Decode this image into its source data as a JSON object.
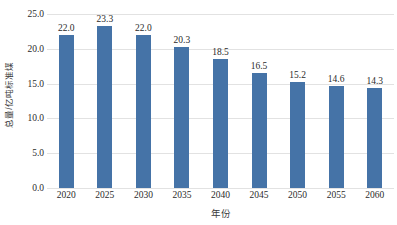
{
  "chart_data": {
    "type": "bar",
    "title": "",
    "subtitle": "",
    "xlabel": "年份",
    "ylabel": "总量/亿吨标准煤",
    "categories": [
      "2020",
      "2025",
      "2030",
      "2035",
      "2040",
      "2045",
      "2050",
      "2055",
      "2060"
    ],
    "values": [
      22.0,
      23.3,
      22.0,
      20.3,
      18.5,
      16.5,
      15.2,
      14.6,
      14.3
    ],
    "data_labels": [
      "22.0",
      "23.3",
      "22.0",
      "20.3",
      "18.5",
      "16.5",
      "15.2",
      "14.6",
      "14.3"
    ],
    "ylim": [
      0.0,
      25.0
    ],
    "y_ticks": [
      0.0,
      5.0,
      10.0,
      15.0,
      20.0,
      25.0
    ],
    "y_tick_labels": [
      "0.0",
      "5.0",
      "10.0",
      "15.0",
      "20.0",
      "25.0"
    ],
    "grid": "horizontal",
    "legend": "none",
    "bar_color": "#4573A7",
    "gridline_color": "#E2E2E2",
    "background_color": "#FFFFFF",
    "text_color": "#2B2B2B"
  }
}
